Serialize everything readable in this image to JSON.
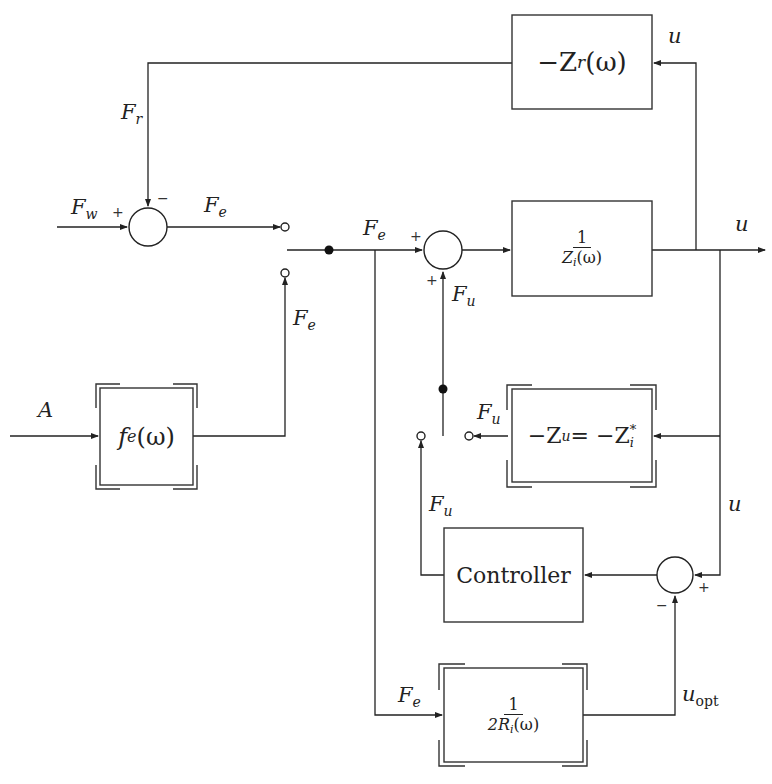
{
  "blocks": {
    "zr": {
      "pre": "−Z",
      "sub": "r",
      "post": "(ω)"
    },
    "zi": {
      "num": "1",
      "den_pre": "Z",
      "den_sub": "i",
      "den_post": "(ω)"
    },
    "fe": {
      "pre": "f",
      "sub": "e",
      "post": "(ω)"
    },
    "zu": {
      "text1": "−Z",
      "sub1": "u",
      "eq": " = −Z",
      "sup2": "*",
      "sub2": "i"
    },
    "controller": {
      "label": "Controller"
    },
    "ri": {
      "num": "1",
      "den_pre": "2R",
      "den_sub": "i",
      "den_post": "(ω)"
    }
  },
  "signals": {
    "F": "F",
    "u": "u",
    "A": "A",
    "sub_r": "r",
    "sub_w": "w",
    "sub_e": "e",
    "sub_u": "u",
    "sub_opt": "opt"
  },
  "signs": {
    "plus": "+",
    "minus": "−"
  }
}
